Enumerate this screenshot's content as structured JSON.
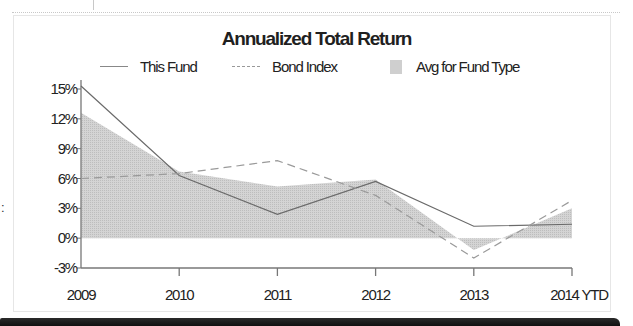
{
  "chart_data": {
    "type": "line",
    "title": "Annualized Total Return",
    "xlabel": "",
    "ylabel": "",
    "categories": [
      "2009",
      "2010",
      "2011",
      "2012",
      "2013",
      "2014 YTD"
    ],
    "series": [
      {
        "name": "This Fund",
        "style": "solid-line",
        "values": [
          15.3,
          6.3,
          2.4,
          5.7,
          1.2,
          1.4
        ]
      },
      {
        "name": "Bond Index",
        "style": "dashed-line",
        "values": [
          6.0,
          6.5,
          7.8,
          4.3,
          -2.0,
          3.8
        ]
      },
      {
        "name": "Avg for Fund Type",
        "style": "area",
        "values": [
          12.6,
          6.7,
          5.2,
          5.9,
          -1.2,
          3.0
        ]
      }
    ],
    "ylim": [
      -3,
      15
    ],
    "yticks": [
      "15%",
      "12%",
      "9%",
      "6%",
      "3%",
      "0%",
      "-3%"
    ],
    "ytick_values": [
      15,
      12,
      9,
      6,
      3,
      0,
      -3
    ],
    "grid": false,
    "legend_position": "top"
  },
  "chart": {
    "title": "Annualized Total Return",
    "legend": [
      {
        "label": "This Fund",
        "icon": "solid-line-icon"
      },
      {
        "label": "Bond Index",
        "icon": "dashed-line-icon"
      },
      {
        "label": "Avg for Fund Type",
        "icon": "gray-fill-swatch-icon"
      }
    ]
  },
  "colors": {
    "fund_line": "#6a6a6a",
    "bond_line": "#9a9a9a",
    "avg_area": "#cfcfcf",
    "axis": "#777777"
  },
  "left_mark": ":"
}
